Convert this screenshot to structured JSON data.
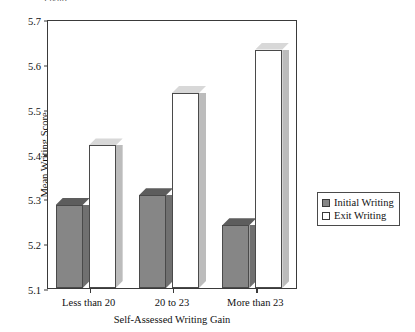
{
  "figure": {
    "title_sliver": "Figure",
    "background": "#ffffff"
  },
  "legend": {
    "position": "right",
    "entries": [
      {
        "label": "Initial Writing",
        "swatch": "initial",
        "color": "#868686"
      },
      {
        "label": "Exit Writing",
        "swatch": "exit",
        "color": "#ffffff"
      }
    ]
  },
  "axes": {
    "ylabel": "Mean Writing Score",
    "xlabel": "Self-Assessed Writing Gain",
    "yticks": [
      "5.1",
      "5.2",
      "5.3",
      "5.4",
      "5.5",
      "5.6",
      "5.7"
    ],
    "xticks": [
      "Less than 20",
      "20 to 23",
      "More than 23"
    ]
  },
  "chart_data": {
    "type": "bar",
    "title": "",
    "xlabel": "Self-Assessed Writing Gain",
    "ylabel": "Mean Writing Score",
    "categories": [
      "Less than 20",
      "20 to 23",
      "More than 23"
    ],
    "series": [
      {
        "name": "Initial Writing",
        "color": "#868686",
        "values": [
          5.285,
          5.307,
          5.24
        ]
      },
      {
        "name": "Exit Writing",
        "color": "#ffffff",
        "values": [
          5.418,
          5.535,
          5.632
        ]
      }
    ],
    "ylim": [
      5.1,
      5.7
    ],
    "ytick_step": 0.1,
    "grid": false,
    "legend_position": "right",
    "style": "3d-bars"
  }
}
